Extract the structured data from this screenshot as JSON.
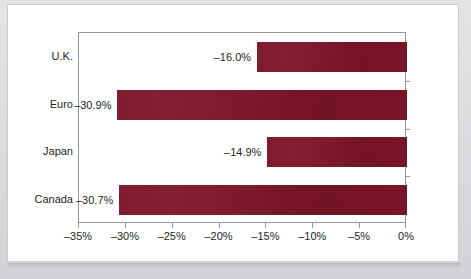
{
  "chart_data": {
    "type": "bar",
    "orientation": "horizontal",
    "title": "",
    "xlabel": "",
    "ylabel": "",
    "categories": [
      "U.K.",
      "Euro",
      "Japan",
      "Canada"
    ],
    "values": [
      -16.0,
      -30.9,
      -14.9,
      -30.7
    ],
    "value_labels": [
      "–16.0%",
      "–30.9%",
      "–14.9%",
      "–30.7%"
    ],
    "xlim": [
      -35,
      0
    ],
    "xtick_values": [
      -35,
      -30,
      -25,
      -20,
      -15,
      -10,
      -5,
      0
    ],
    "xtick_labels": [
      "–35%",
      "–30%",
      "–25%",
      "–20%",
      "–15%",
      "–10%",
      "–5%",
      "0%"
    ],
    "grid": false,
    "legend": null,
    "series_color": "#7b1527",
    "axis_color": "#8e96a3",
    "text_color": "#1d1f24",
    "plot_background": "#ffffff",
    "card_background": "#ffffff",
    "page_background": "#d9dadc"
  }
}
